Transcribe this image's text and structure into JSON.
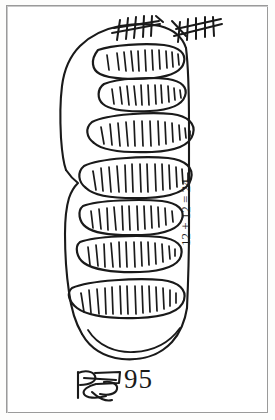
{
  "artwork": {
    "medium": "black ink pen on white paper",
    "style": "hand-drawn sketch",
    "frame_color": "#9a9a9a",
    "ink_color": "#1a1a1a",
    "paper_color": "#ffffff"
  },
  "subject": {
    "description": "vertical ovoid body outline containing stacked hatched ovals",
    "oval_count": 7,
    "ovals": [
      {
        "index": 1,
        "hatch_marks": 11,
        "position": "top"
      },
      {
        "index": 2,
        "hatch_marks": 11,
        "position": "upper"
      },
      {
        "index": 3,
        "hatch_marks": 13,
        "position": "upper-middle"
      },
      {
        "index": 4,
        "hatch_marks": 14,
        "position": "middle"
      },
      {
        "index": 5,
        "hatch_marks": 12,
        "position": "lower-middle"
      },
      {
        "index": 6,
        "hatch_marks": 13,
        "position": "lower"
      },
      {
        "index": 7,
        "hatch_marks": 14,
        "position": "bottom"
      }
    ]
  },
  "tally_marks": {
    "label": "tally marks",
    "groups": [
      {
        "group": 1,
        "strokes": 5,
        "crossed": true,
        "value": 5
      },
      {
        "group": 2,
        "strokes": 5,
        "crossed": true,
        "value": 5
      }
    ],
    "total": 10
  },
  "annotations": {
    "equation": "12 + 12 = 24",
    "equation_orientation": "rotated 90 degrees counter-clockwise",
    "caption_number": "95",
    "signature": "scribbled monogram"
  }
}
